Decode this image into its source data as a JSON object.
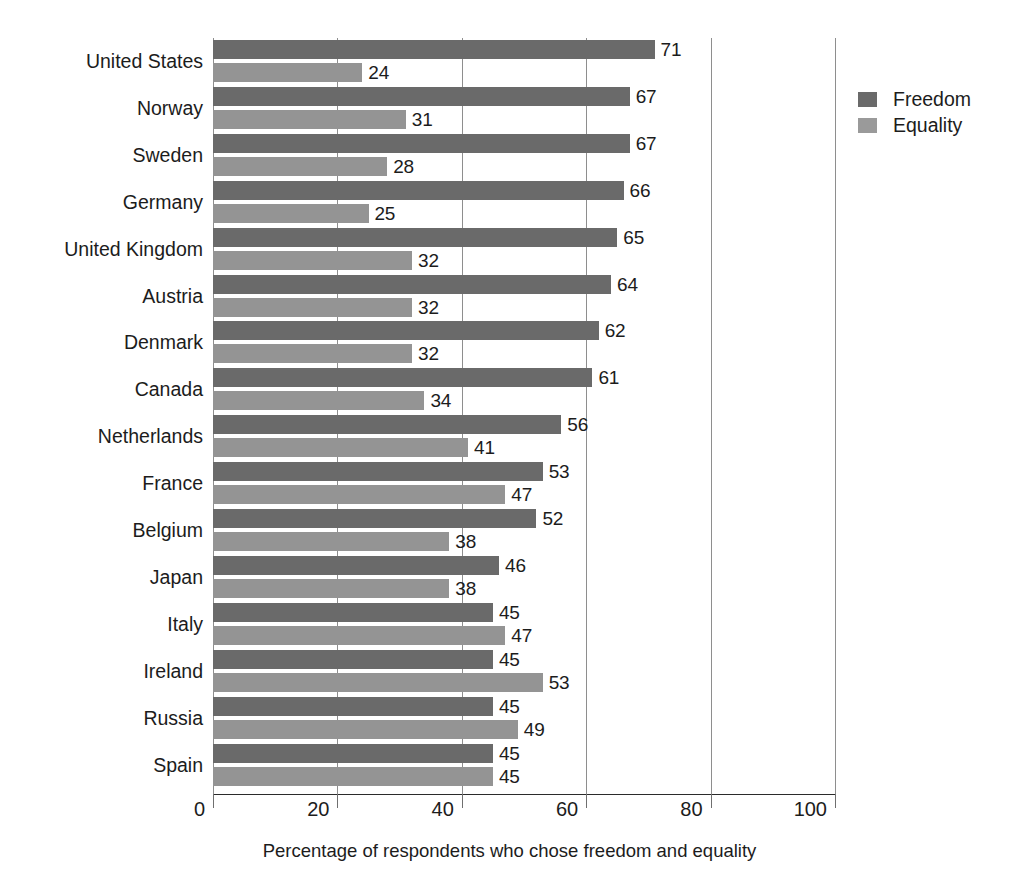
{
  "chart_data": {
    "type": "bar",
    "orientation": "horizontal",
    "title": "",
    "xlabel": "Percentage of respondents who chose freedom and equality",
    "ylabel": "",
    "xlim": [
      0,
      100
    ],
    "xticks": [
      0,
      20,
      40,
      60,
      80,
      100
    ],
    "xtick_labels": [
      "0",
      "20",
      "40",
      "60",
      "80",
      "100"
    ],
    "grid": true,
    "grid_axis": "x",
    "legend_position": "top-right",
    "categories": [
      "United States",
      "Norway",
      "Sweden",
      "Germany",
      "United Kingdom",
      "Austria",
      "Denmark",
      "Canada",
      "Netherlands",
      "France",
      "Belgium",
      "Japan",
      "Italy",
      "Ireland",
      "Russia",
      "Spain"
    ],
    "series": [
      {
        "name": "Freedom",
        "color": "#6a6a6a",
        "values": [
          71,
          67,
          67,
          66,
          65,
          64,
          62,
          61,
          56,
          53,
          52,
          46,
          45,
          45,
          45,
          45
        ]
      },
      {
        "name": "Equality",
        "color": "#949494",
        "values": [
          24,
          31,
          28,
          25,
          32,
          32,
          32,
          34,
          41,
          47,
          38,
          38,
          47,
          53,
          49,
          45
        ]
      }
    ],
    "data_labels": {
      "Freedom": [
        "71",
        "67",
        "67",
        "66",
        "65",
        "64",
        "62",
        "61",
        "56",
        "53",
        "52",
        "46",
        "45",
        "45",
        "45",
        "45"
      ],
      "Equality": [
        "24",
        "31",
        "28",
        "25",
        "32",
        "32",
        "32",
        "34",
        "41",
        "47",
        "38",
        "38",
        "47",
        "53",
        "49",
        "45"
      ]
    }
  },
  "legend": {
    "items": [
      {
        "label": "Freedom",
        "color": "#6a6a6a"
      },
      {
        "label": "Equality",
        "color": "#9a9a9a"
      }
    ]
  }
}
